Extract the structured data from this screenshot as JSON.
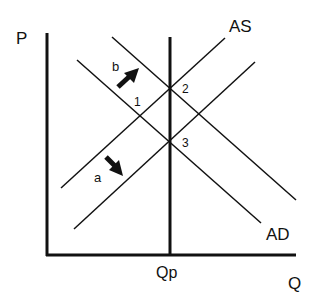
{
  "diagram": {
    "axes": {
      "y_label": "P",
      "x_label": "Q",
      "vertical_marker_label": "Qp"
    },
    "curves": {
      "as_label": "AS",
      "ad_label": "AD"
    },
    "shift_labels": {
      "a": "a",
      "b": "b"
    },
    "points": {
      "p1": "1",
      "p2": "2",
      "p3": "3"
    },
    "colors": {
      "line": "#111111",
      "background": "#ffffff"
    }
  }
}
